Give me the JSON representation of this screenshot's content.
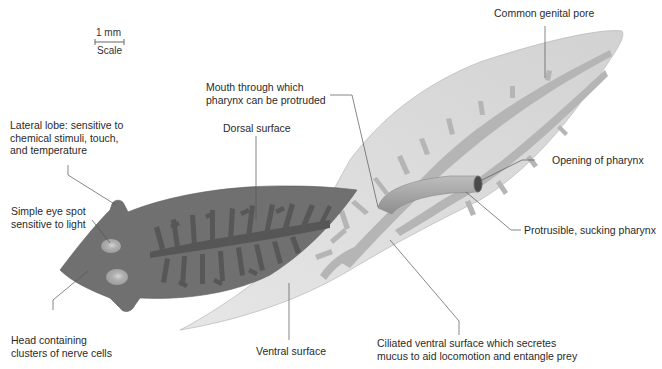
{
  "diagram": {
    "scale": {
      "value": "1 mm",
      "label": "Scale"
    },
    "labels": {
      "lateral_lobe": [
        "Lateral lobe: sensitive to",
        "chemical stimuli, touch,",
        "and temperature"
      ],
      "eye_spot": [
        "Simple eye spot",
        "sensitive to light"
      ],
      "head": [
        "Head containing",
        "clusters of nerve cells"
      ],
      "mouth": [
        "Mouth through which",
        "pharynx can be protruded"
      ],
      "dorsal": [
        "Dorsal surface"
      ],
      "ventral": [
        "Ventral surface"
      ],
      "ciliated": [
        "Ciliated ventral surface which secretes",
        "mucus to aid locomotion and entangle prey"
      ],
      "genital_pore": [
        "Common genital pore"
      ],
      "pharynx_opening": [
        "Opening of pharynx"
      ],
      "pharynx": [
        "Protrusible, sucking pharynx"
      ]
    },
    "colors": {
      "dorsal_body": "#6f6f6f",
      "dorsal_gut": "#555555",
      "gut_branches_dark": "#595959",
      "ventral_body": "#d9d9d9",
      "ventral_gut": "#b3b3b3",
      "eye_spot": "#a8a8a8",
      "pharynx": "#a0a0a0",
      "leader_line": "#555555"
    }
  }
}
